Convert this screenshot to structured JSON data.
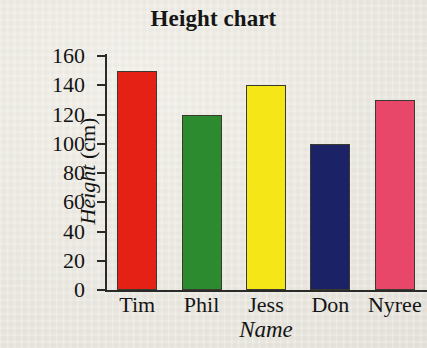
{
  "chart_data": {
    "type": "bar",
    "title": "Height chart",
    "xlabel": "Name",
    "ylabel_italic": "Height",
    "ylabel_upright": " (cm)",
    "ylabel": "Height (cm)",
    "categories": [
      "Tim",
      "Phil",
      "Jess",
      "Don",
      "Nyree"
    ],
    "values": [
      150,
      120,
      140,
      100,
      130
    ],
    "colors": [
      "#e52015",
      "#2b8b2e",
      "#f5e617",
      "#1b2265",
      "#e8476a"
    ],
    "ylim": [
      0,
      160
    ],
    "yticks": [
      0,
      20,
      40,
      60,
      80,
      100,
      120,
      140,
      160
    ],
    "ytick_labels": [
      "0",
      "20",
      "40",
      "60",
      "80",
      "100",
      "120",
      "140",
      "160"
    ],
    "grid": false,
    "legend": "none",
    "bar_border_color": "#3a3a30",
    "axis_color": "#2a2a28",
    "background_color": "#eceae2",
    "series": [
      {
        "name": "Height",
        "values": [
          150,
          120,
          140,
          100,
          130
        ]
      }
    ]
  }
}
